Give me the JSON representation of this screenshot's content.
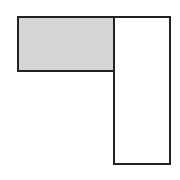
{
  "diagram": {
    "shapes": [
      {
        "id": "shaded-rect",
        "x": 17,
        "y": 16,
        "width": 98,
        "height": 56,
        "fill": "#d6d6d6",
        "stroke": "#222222"
      },
      {
        "id": "tall-rect",
        "x": 113,
        "y": 16,
        "width": 58,
        "height": 149,
        "fill": "#ffffff",
        "stroke": "#222222"
      }
    ]
  }
}
